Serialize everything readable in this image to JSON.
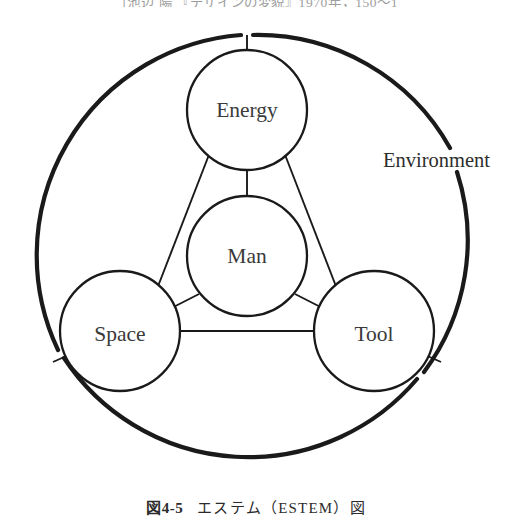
{
  "page": {
    "top_cut_text": "〔池辺 陽 『デザインの変貌』1970年，150〜1",
    "background_color": "#ffffff",
    "ink_color": "#1a1a1a"
  },
  "caption": {
    "figure_number": "図4-5",
    "title": "エステム（ESTEM）図",
    "full": "図4-5　エステム（ESTEM）図"
  },
  "diagram": {
    "type": "estem-venn-node-diagram",
    "outer_ring": {
      "label": "Environment",
      "label_position": "right-outside",
      "stroke_color": "#1a1a1a",
      "center": {
        "x": 247,
        "y": 256
      },
      "radius": 221,
      "stroke_width": 4
    },
    "nodes": [
      {
        "id": "energy",
        "label": "Energy",
        "cx": 247,
        "cy": 110,
        "r": 60
      },
      {
        "id": "man",
        "label": "Man",
        "cx": 247,
        "cy": 256,
        "r": 60
      },
      {
        "id": "space",
        "label": "Space",
        "cx": 120,
        "cy": 331,
        "r": 60
      },
      {
        "id": "tool",
        "label": "Tool",
        "cx": 374,
        "cy": 331,
        "r": 60
      }
    ],
    "edges": [
      {
        "from": "energy",
        "to": "space"
      },
      {
        "from": "energy",
        "to": "tool"
      },
      {
        "from": "space",
        "to": "tool"
      },
      {
        "from": "energy",
        "to": "man"
      },
      {
        "from": "space",
        "to": "man"
      },
      {
        "from": "tool",
        "to": "man"
      },
      {
        "from": "energy",
        "to": "environment"
      },
      {
        "from": "space",
        "to": "environment"
      },
      {
        "from": "tool",
        "to": "environment"
      }
    ],
    "acronym": "ESTEM",
    "acronym_expansion": [
      "Energy",
      "Space",
      "Tool",
      "Environment",
      "Man"
    ]
  }
}
